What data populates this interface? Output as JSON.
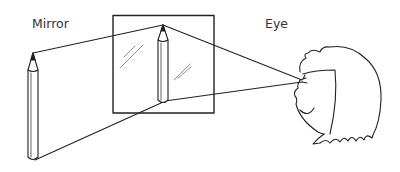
{
  "diagram": {
    "labels": {
      "mirror": "Mirror",
      "eye": "Eye"
    },
    "elements": [
      {
        "id": "object-pencil",
        "description": "Real pencil standing in front of mirror"
      },
      {
        "id": "mirror",
        "description": "Square mirror with glass reflection marks"
      },
      {
        "id": "image-pencil",
        "description": "Reflected pencil image inside the mirror"
      },
      {
        "id": "observer",
        "description": "Girl's head with eye viewing mirror"
      },
      {
        "id": "light-rays",
        "description": "Rays from pencil tip and base to mirror and from mirror to the eye"
      }
    ],
    "colors": {
      "stroke": "#222222",
      "background": "#ffffff"
    }
  }
}
